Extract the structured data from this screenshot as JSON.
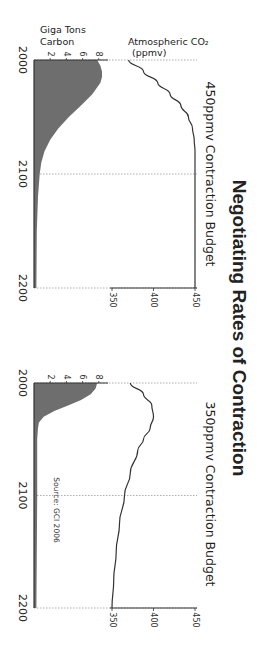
{
  "title": "Negotiating Rates of Contraction",
  "source": "Source:  GCI 2006",
  "axis_labels": {
    "emissions": "Giga Tons Carbon",
    "emissions_line1": "Giga Tons",
    "emissions_line2": "Carbon",
    "co2": "Atmospheric CO₂ (ppmv)",
    "co2_line1": "Atmospheric CO₂",
    "co2_line2": "(ppmv)"
  },
  "colors": {
    "area_fill": "#6e6e6e",
    "line": "#333333",
    "grid": "#999999",
    "background": "#ffffff"
  },
  "orientation": "rotated 90deg clockwise",
  "chart_data": [
    {
      "type": "area+line",
      "title": "450ppmv Contraction Budget",
      "x_label": "Year",
      "x_ticks": [
        "2000",
        "2100",
        "2200"
      ],
      "xlim": [
        2000,
        2200
      ],
      "left_axis": {
        "label": "Giga Tons Carbon",
        "ticks": [
          "2",
          "4",
          "6",
          "8"
        ],
        "ylim": [
          0,
          9
        ]
      },
      "right_axis": {
        "label": "Atmospheric CO₂ (ppmv)",
        "ticks": [
          "350",
          "400",
          "450"
        ],
        "ylim": [
          300,
          450
        ]
      },
      "grid": "dotted vertical at 2000, 2100, 2200",
      "series": [
        {
          "name": "Emissions (GtC)",
          "type": "area",
          "x": [
            2000,
            2005,
            2010,
            2015,
            2020,
            2030,
            2040,
            2050,
            2060,
            2070,
            2080,
            2090,
            2100,
            2120,
            2150,
            2200
          ],
          "values": [
            7.8,
            8.2,
            8.4,
            8.4,
            8.2,
            7.2,
            5.8,
            4.3,
            3.0,
            2.0,
            1.3,
            0.9,
            0.7,
            0.5,
            0.35,
            0.3
          ]
        },
        {
          "name": "Atmospheric CO₂ (ppmv)",
          "type": "line",
          "x": [
            2000,
            2010,
            2020,
            2030,
            2040,
            2050,
            2060,
            2070,
            2080,
            2100,
            2150,
            2200
          ],
          "values": [
            370,
            388,
            405,
            420,
            433,
            442,
            447,
            449,
            450,
            450,
            450,
            450
          ]
        }
      ]
    },
    {
      "type": "area+line",
      "title": "350ppmv Contraction Budget",
      "x_label": "Year",
      "x_ticks": [
        "2000",
        "2100",
        "2200"
      ],
      "xlim": [
        2000,
        2200
      ],
      "left_axis": {
        "label": "Giga Tons Carbon",
        "ticks": [
          "2",
          "4",
          "6",
          "8"
        ],
        "ylim": [
          0,
          9
        ]
      },
      "right_axis": {
        "label": "Atmospheric CO₂ (ppmv)",
        "ticks": [
          "350",
          "400",
          "450"
        ],
        "ylim": [
          300,
          450
        ]
      },
      "grid": "dotted vertical at 2000, 2100, 2200",
      "annotation": "Source:  GCI 2006",
      "series": [
        {
          "name": "Emissions (GtC)",
          "type": "area",
          "x": [
            2000,
            2005,
            2010,
            2015,
            2020,
            2025,
            2030,
            2035,
            2040,
            2050,
            2100,
            2150,
            2200
          ],
          "values": [
            7.8,
            7.6,
            7.0,
            5.8,
            4.2,
            2.5,
            1.2,
            0.6,
            0.5,
            0.4,
            0.4,
            0.35,
            0.3
          ]
        },
        {
          "name": "Atmospheric CO₂ (ppmv)",
          "type": "line",
          "x": [
            2000,
            2010,
            2020,
            2030,
            2040,
            2050,
            2060,
            2080,
            2100,
            2125,
            2150,
            2175,
            2200
          ],
          "values": [
            372,
            388,
            398,
            400,
            396,
            388,
            381,
            372,
            365,
            359,
            355,
            352,
            350
          ]
        }
      ]
    }
  ]
}
